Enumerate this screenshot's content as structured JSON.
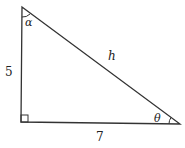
{
  "diagram": {
    "type": "right-triangle",
    "sides": {
      "vertical_leg": "5",
      "horizontal_leg": "7",
      "hypotenuse": "h"
    },
    "angles": {
      "top": "α",
      "bottom_right": "θ",
      "bottom_left": "right-angle"
    },
    "colors": {
      "stroke": "#333333",
      "background": "#ffffff"
    }
  }
}
